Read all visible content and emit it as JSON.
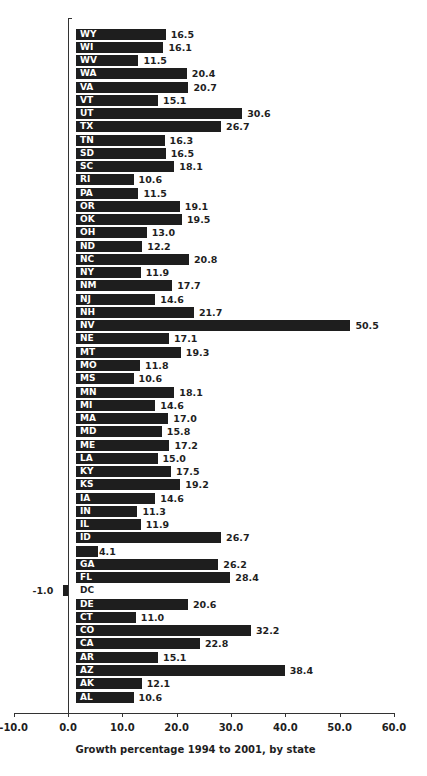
{
  "chart_data": {
    "type": "bar",
    "orientation": "horizontal",
    "title": "",
    "xlabel": "Growth percentage 1994 to 2001, by state",
    "ylabel": "",
    "xlim": [
      -10,
      60
    ],
    "x_ticks": [
      "-10.0",
      "0.0",
      "10.0",
      "20.0",
      "30.0",
      "40.0",
      "50.0",
      "60.0"
    ],
    "grid": false,
    "legend": null,
    "categories": [
      "WY",
      "WI",
      "WV",
      "WA",
      "VA",
      "VT",
      "UT",
      "TX",
      "TN",
      "SD",
      "SC",
      "RI",
      "PA",
      "OR",
      "OK",
      "OH",
      "ND",
      "NC",
      "NY",
      "NM",
      "NJ",
      "NH",
      "NV",
      "NE",
      "MT",
      "MO",
      "MS",
      "MN",
      "MI",
      "MA",
      "MD",
      "ME",
      "LA",
      "KY",
      "KS",
      "IA",
      "IN",
      "IL",
      "ID",
      "HI",
      "GA",
      "FL",
      "DC",
      "DE",
      "CT",
      "CO",
      "CA",
      "AR",
      "AZ",
      "AK",
      "AL"
    ],
    "values": [
      16.5,
      16.1,
      11.5,
      20.4,
      20.7,
      15.1,
      30.6,
      26.7,
      16.3,
      16.5,
      18.1,
      10.6,
      11.5,
      19.1,
      19.5,
      13.0,
      12.2,
      20.8,
      11.9,
      17.7,
      14.6,
      21.7,
      50.5,
      17.1,
      19.3,
      11.8,
      10.6,
      18.1,
      14.6,
      17.0,
      15.8,
      17.2,
      15.0,
      17.5,
      19.2,
      14.6,
      11.3,
      11.9,
      26.7,
      4.1,
      26.2,
      28.4,
      -1.0,
      20.6,
      11.0,
      32.2,
      22.8,
      15.1,
      38.4,
      12.1,
      10.6
    ],
    "value_labels": [
      "16.5",
      "16.1",
      "11.5",
      "20.4",
      "20.7",
      "15.1",
      "30.6",
      "26.7",
      "16.3",
      "16.5",
      "18.1",
      "10.6",
      "11.5",
      "19.1",
      "19.5",
      "13.0",
      "12.2",
      "20.8",
      "11.9",
      "17.7",
      "14.6",
      "21.7",
      "50.5",
      "17.1",
      "19.3",
      "11.8",
      "10.6",
      "18.1",
      "14.6",
      "17.0",
      "15.8",
      "17.2",
      "15.0",
      "17.5",
      "19.2",
      "14.6",
      "11.3",
      "11.9",
      "26.7",
      "4.1",
      "26.2",
      "28.4",
      "-1.0",
      "20.6",
      "11.0",
      "32.2",
      "22.8",
      "15.1",
      "38.4",
      "12.1",
      "10.6"
    ],
    "bar_color": "#1e1e1e"
  }
}
